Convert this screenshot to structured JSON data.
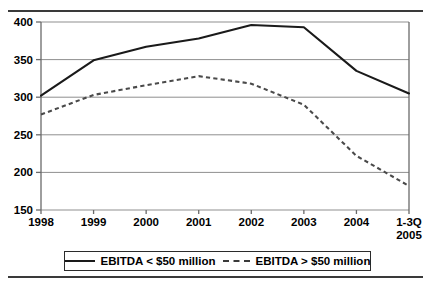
{
  "chart_data": {
    "type": "line",
    "title": "",
    "subtitle": "",
    "xlabel": "",
    "ylabel": "",
    "categories": [
      "1998",
      "1999",
      "2000",
      "2001",
      "2002",
      "2003",
      "2004",
      "1-3Q 2005"
    ],
    "ylim": [
      150,
      400
    ],
    "yticks": [
      150,
      200,
      250,
      300,
      350,
      400
    ],
    "grid": true,
    "legend_position": "bottom",
    "series": [
      {
        "name": "EBITDA < $50 million",
        "style": "solid",
        "color": "#1a1a1a",
        "values": [
          302,
          349,
          367,
          378,
          396,
          393,
          335,
          305
        ]
      },
      {
        "name": "EBITDA > $50 million",
        "style": "dashed",
        "color": "#4a4a4a",
        "values": [
          277,
          303,
          316,
          328,
          318,
          290,
          222,
          182
        ]
      }
    ]
  },
  "axis": {
    "y_labels": [
      "400",
      "350",
      "300",
      "250",
      "200",
      "150"
    ],
    "x_labels": [
      {
        "line1": "1998",
        "line2": ""
      },
      {
        "line1": "1999",
        "line2": ""
      },
      {
        "line1": "2000",
        "line2": ""
      },
      {
        "line1": "2001",
        "line2": ""
      },
      {
        "line1": "2002",
        "line2": ""
      },
      {
        "line1": "2003",
        "line2": ""
      },
      {
        "line1": "2004",
        "line2": ""
      },
      {
        "line1": "1-3Q",
        "line2": "2005"
      }
    ]
  },
  "legend": {
    "items": [
      {
        "label": "EBITDA < $50 million",
        "style": "solid"
      },
      {
        "label": "EBITDA > $50 million",
        "style": "dashed"
      }
    ]
  }
}
